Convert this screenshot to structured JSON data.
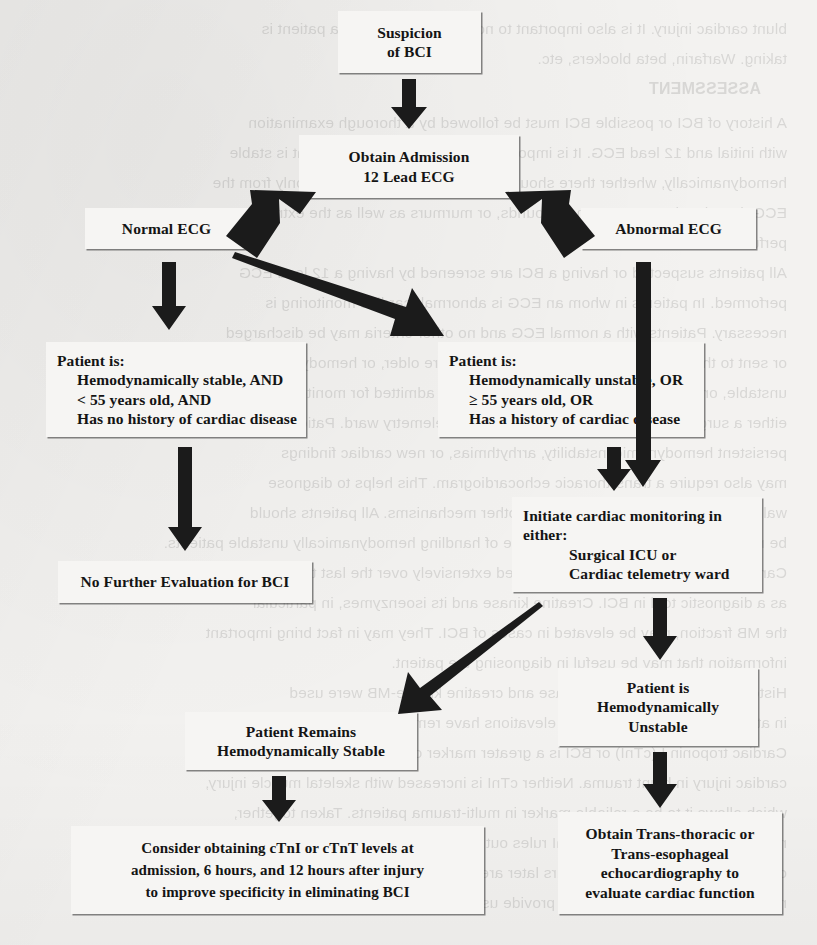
{
  "figure": {
    "type": "flowchart",
    "topic": "Blunt Cardiac Injury (BCI) evaluation algorithm"
  },
  "nodes": {
    "suspicion": {
      "lines": [
        "Suspicion",
        "of BCI"
      ]
    },
    "admission_ecg": {
      "lines": [
        "Obtain Admission",
        "12 Lead ECG"
      ]
    },
    "normal_ecg": {
      "lines": [
        "Normal ECG"
      ]
    },
    "abnormal_ecg": {
      "lines": [
        "Abnormal ECG"
      ]
    },
    "patient_stable_criteria": {
      "lines": [
        "Patient is:",
        "Hemodynamically stable, AND",
        "< 55 years old, AND",
        "Has no history of cardiac disease"
      ]
    },
    "patient_unstable_criteria": {
      "lines": [
        "Patient is:",
        "Hemodynamically unstable, OR",
        "≥ 55 years old, OR",
        "Has a history of cardiac disease"
      ]
    },
    "no_further_eval": {
      "lines": [
        "No Further Evaluation for BCI"
      ]
    },
    "initiate_monitoring": {
      "lines": [
        "Initiate cardiac monitoring in",
        "either:",
        "Surgical ICU or",
        "Cardiac telemetry ward"
      ]
    },
    "remains_stable": {
      "lines": [
        "Patient Remains",
        "Hemodynamically Stable"
      ]
    },
    "is_unstable": {
      "lines": [
        "Patient is",
        "Hemodynamically",
        "Unstable"
      ]
    },
    "troponin": {
      "lines": [
        "Consider obtaining cTnI or cTnT levels at",
        "admission,  6 hours, and 12 hours after injury",
        "to improve specificity in eliminating BCI"
      ]
    },
    "echo": {
      "lines": [
        "Obtain Trans-thoracic or",
        "Trans-esophageal",
        "echocardiography to",
        "evaluate cardiac function"
      ]
    }
  },
  "bleed_text": {
    "lines": [
      "blunt cardiac injury. It is also important to note any medications a patient is",
      "taking. Warfarin, beta blockers, etc.",
      "ASSESSMENT",
      "A history of BCI or possible BCI must be followed by a thorough examination",
      "with initial and 12 lead ECG. It is important to note whether the patient is stable",
      "hemodynamically, whether there should be concern, determined not only from the",
      "ECG, but also the murmurs, new sounds, or murmurs as well as the extremity",
      "perfusion.",
      "All patients suspected or having a BCI are screened by having a 12 lead ECG",
      "performed. In patients in whom an ECG is abnormal, cardiac monitoring is",
      "necessary. Patients with a normal ECG and no other criteria may be discharged",
      "or sent to the floor as appropriate. Patients who are older, or hemodynamically",
      "unstable, or have a history of cardiac disease are admitted for monitoring in",
      "either a surgical intensive care unit or a cardiac telemetry ward. Patients with",
      "persistent hemodynamic instability, arrhythmias, or new cardiac findings",
      "may also require a trans-thoracic echocardiogram. This helps to diagnose",
      "wall motion abnormalities and identify other mechanisms. All patients should",
      "be monitored in an environment capable of handling hemodynamically unstable patients.",
      "Cardiac enzymes have been investigated extensively over the last two decades",
      "as a diagnostic tool in BCI. Creatine kinase and its isoenzymes, in particular",
      "the MB fraction, may be elevated in cases of BCI. They may in fact bring important",
      "information that may be useful in diagnosing the patient.",
      "Historically, cardiac creatine kinase and creatine kinase-MB were used",
      "in attempting to identify BCI, but elevations have remained poorly understood.",
      "Cardiac troponin I (cTnI) or BCI is a greater marker of more specificity predicting",
      "cardiac injury in blunt trauma. Neither cTnI is increased with skeletal muscle injury,",
      "which allows it to be a reliable marker in multi-trauma patients. Taken together,",
      "normal findings on ECG and cTnI rules out BCI. Therefore, an ECG and cTnI",
      "obtained at admission and 6 hours later are used to determine the appropriate",
      "management. Elevations in cTnI provide useful evidence of cardiac involvement."
    ]
  }
}
